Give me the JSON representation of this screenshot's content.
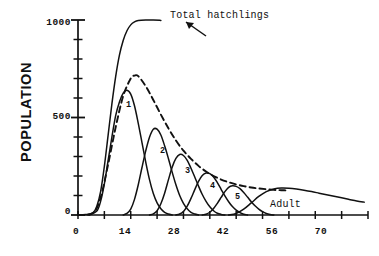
{
  "chart_data": {
    "type": "line",
    "title": "",
    "xlabel": "",
    "ylabel": "POPULATION",
    "xlim": [
      0,
      77
    ],
    "ylim": [
      0,
      1000
    ],
    "grid": false,
    "legend_position": "inline-annotations",
    "x_ticks_major": [
      0,
      14,
      28,
      42,
      56,
      70
    ],
    "x_tick_labels": [
      "0",
      "14",
      "28",
      "42",
      "56",
      "70"
    ],
    "x_ticks_minor_step": 7,
    "y_ticks_major": [
      0,
      500,
      1000
    ],
    "y_tick_labels": [
      "0",
      "500",
      "1000"
    ],
    "y_ticks_minor_step": 100,
    "annotations": [
      {
        "name": "total-hatchlings",
        "text": "Total hatchlings",
        "x": 30,
        "y": 985,
        "arrow_to_x": 22.5,
        "arrow_to_y": 975
      },
      {
        "name": "adult",
        "text": "Adult",
        "x": 53,
        "y": 95
      }
    ],
    "series": [
      {
        "name": "Total hatchlings",
        "style": "solid",
        "label": "Total hatchlings",
        "points": [
          [
            0,
            0
          ],
          [
            2,
            2
          ],
          [
            4,
            12
          ],
          [
            5,
            45
          ],
          [
            6,
            120
          ],
          [
            7,
            250
          ],
          [
            8,
            410
          ],
          [
            9,
            570
          ],
          [
            10,
            710
          ],
          [
            11,
            820
          ],
          [
            12,
            895
          ],
          [
            13,
            945
          ],
          [
            14,
            975
          ],
          [
            15,
            990
          ],
          [
            16,
            997
          ],
          [
            18,
            1000
          ],
          [
            20,
            1000
          ],
          [
            22,
            998
          ]
        ]
      },
      {
        "name": "Total larvae (dashed)",
        "style": "dashed",
        "label": "",
        "points": [
          [
            0,
            0
          ],
          [
            4,
            10
          ],
          [
            6,
            90
          ],
          [
            8,
            260
          ],
          [
            10,
            450
          ],
          [
            12,
            610
          ],
          [
            14,
            700
          ],
          [
            15,
            715
          ],
          [
            16,
            712
          ],
          [
            18,
            660
          ],
          [
            20,
            590
          ],
          [
            22,
            515
          ],
          [
            24,
            445
          ],
          [
            26,
            382
          ],
          [
            28,
            330
          ],
          [
            30,
            288
          ],
          [
            32,
            252
          ],
          [
            34,
            223
          ],
          [
            36,
            200
          ],
          [
            38,
            182
          ],
          [
            40,
            168
          ],
          [
            42,
            157
          ],
          [
            44,
            148
          ],
          [
            46,
            141
          ],
          [
            48,
            136
          ],
          [
            50,
            132
          ],
          [
            52,
            129
          ],
          [
            54,
            127
          ],
          [
            56,
            126
          ]
        ]
      },
      {
        "name": "Instar 1",
        "style": "solid",
        "label": "1",
        "peak_x": 13,
        "peak_y": 640,
        "label_x": 12.8,
        "label_y": 440,
        "points": [
          [
            3,
            0
          ],
          [
            5,
            20
          ],
          [
            6,
            70
          ],
          [
            7,
            160
          ],
          [
            8,
            280
          ],
          [
            9,
            400
          ],
          [
            10,
            510
          ],
          [
            11,
            580
          ],
          [
            12,
            625
          ],
          [
            13,
            640
          ],
          [
            14,
            620
          ],
          [
            15,
            560
          ],
          [
            16,
            470
          ],
          [
            17,
            370
          ],
          [
            18,
            270
          ],
          [
            19,
            180
          ],
          [
            20,
            110
          ],
          [
            21,
            62
          ],
          [
            22,
            32
          ],
          [
            23,
            14
          ],
          [
            24,
            5
          ],
          [
            25,
            0
          ]
        ]
      },
      {
        "name": "Instar 2",
        "style": "solid",
        "label": "2",
        "peak_x": 20,
        "peak_y": 440,
        "label_x": 20.5,
        "label_y": 300,
        "points": [
          [
            12,
            0
          ],
          [
            13,
            8
          ],
          [
            14,
            30
          ],
          [
            15,
            80
          ],
          [
            16,
            155
          ],
          [
            17,
            245
          ],
          [
            18,
            330
          ],
          [
            19,
            400
          ],
          [
            20,
            440
          ],
          [
            21,
            440
          ],
          [
            22,
            410
          ],
          [
            23,
            355
          ],
          [
            24,
            290
          ],
          [
            25,
            220
          ],
          [
            26,
            155
          ],
          [
            27,
            100
          ],
          [
            28,
            60
          ],
          [
            29,
            32
          ],
          [
            30,
            14
          ],
          [
            31,
            5
          ],
          [
            32,
            0
          ]
        ]
      },
      {
        "name": "Instar 3",
        "style": "solid",
        "label": "3",
        "peak_x": 27,
        "peak_y": 310,
        "label_x": 27.5,
        "label_y": 215,
        "points": [
          [
            19,
            0
          ],
          [
            20,
            6
          ],
          [
            21,
            22
          ],
          [
            22,
            58
          ],
          [
            23,
            112
          ],
          [
            24,
            180
          ],
          [
            25,
            245
          ],
          [
            26,
            290
          ],
          [
            27,
            310
          ],
          [
            28,
            305
          ],
          [
            29,
            280
          ],
          [
            30,
            240
          ],
          [
            31,
            195
          ],
          [
            32,
            148
          ],
          [
            33,
            105
          ],
          [
            34,
            70
          ],
          [
            35,
            42
          ],
          [
            36,
            22
          ],
          [
            37,
            9
          ],
          [
            38,
            3
          ],
          [
            39,
            0
          ]
        ]
      },
      {
        "name": "Instar 4",
        "style": "solid",
        "label": "4",
        "peak_x": 34,
        "peak_y": 215,
        "label_x": 34.5,
        "label_y": 140,
        "points": [
          [
            26,
            0
          ],
          [
            27,
            5
          ],
          [
            28,
            18
          ],
          [
            29,
            45
          ],
          [
            30,
            85
          ],
          [
            31,
            130
          ],
          [
            32,
            172
          ],
          [
            33,
            202
          ],
          [
            34,
            215
          ],
          [
            35,
            212
          ],
          [
            36,
            195
          ],
          [
            37,
            166
          ],
          [
            38,
            132
          ],
          [
            39,
            98
          ],
          [
            40,
            68
          ],
          [
            41,
            43
          ],
          [
            42,
            25
          ],
          [
            43,
            12
          ],
          [
            44,
            4
          ],
          [
            45,
            0
          ]
        ]
      },
      {
        "name": "Instar 5",
        "style": "solid",
        "label": "5",
        "peak_x": 41,
        "peak_y": 150,
        "label_x": 41.5,
        "label_y": 92,
        "points": [
          [
            33,
            0
          ],
          [
            34,
            4
          ],
          [
            35,
            14
          ],
          [
            36,
            33
          ],
          [
            37,
            60
          ],
          [
            38,
            90
          ],
          [
            39,
            120
          ],
          [
            40,
            142
          ],
          [
            41,
            150
          ],
          [
            42,
            147
          ],
          [
            43,
            135
          ],
          [
            44,
            115
          ],
          [
            45,
            92
          ],
          [
            46,
            68
          ],
          [
            47,
            47
          ],
          [
            48,
            30
          ],
          [
            49,
            17
          ],
          [
            50,
            8
          ],
          [
            51,
            3
          ],
          [
            52,
            0
          ]
        ]
      },
      {
        "name": "Adult",
        "style": "solid",
        "label": "Adult",
        "points": [
          [
            40,
            0
          ],
          [
            42,
            8
          ],
          [
            44,
            30
          ],
          [
            46,
            62
          ],
          [
            48,
            95
          ],
          [
            50,
            120
          ],
          [
            52,
            133
          ],
          [
            54,
            138
          ],
          [
            56,
            137
          ],
          [
            58,
            133
          ],
          [
            60,
            127
          ],
          [
            62,
            120
          ],
          [
            64,
            112
          ],
          [
            66,
            104
          ],
          [
            68,
            96
          ],
          [
            70,
            88
          ],
          [
            72,
            80
          ],
          [
            74,
            72
          ],
          [
            76,
            66
          ]
        ]
      }
    ]
  },
  "axis": {
    "y_title": "POPULATION",
    "y_labels": [
      "1000",
      "500",
      "0"
    ],
    "x_labels": [
      "0",
      "14",
      "28",
      "42",
      "56",
      "70"
    ]
  },
  "labels": {
    "instar_1": "1",
    "instar_2": "2",
    "instar_3": "3",
    "instar_4": "4",
    "instar_5": "5",
    "total_hatchlings": "Total hatchlings",
    "adult": "Adult"
  },
  "colors": {
    "ink": "#111111",
    "background": "#ffffff"
  }
}
